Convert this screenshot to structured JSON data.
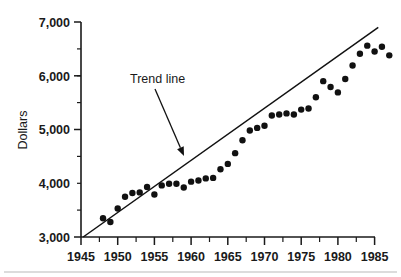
{
  "chart_data": {
    "type": "scatter",
    "title": "",
    "xlabel": "",
    "ylabel": "Dollars",
    "xlim": [
      1945,
      1985
    ],
    "ylim": [
      3000,
      7000
    ],
    "grid": false,
    "legend": "none",
    "x_ticks": [
      1945,
      1950,
      1955,
      1960,
      1965,
      1970,
      1975,
      1980,
      1985
    ],
    "x_tick_labels": [
      "1945",
      "1950",
      "1955",
      "1960",
      "1965",
      "1970",
      "1975",
      "1980",
      "1985"
    ],
    "x_minor_step": 2.5,
    "y_ticks": [
      3000,
      4000,
      5000,
      6000,
      7000
    ],
    "y_tick_labels": [
      "3,000",
      "4,000",
      "5,000",
      "6,000",
      "7,000"
    ],
    "y_minor_step": 500,
    "marker_color": "#111111",
    "marker_radius": 3.2,
    "points": [
      {
        "x": 1948,
        "y": 3350
      },
      {
        "x": 1949,
        "y": 3280
      },
      {
        "x": 1950,
        "y": 3530
      },
      {
        "x": 1951,
        "y": 3750
      },
      {
        "x": 1952,
        "y": 3820
      },
      {
        "x": 1953,
        "y": 3830
      },
      {
        "x": 1954,
        "y": 3930
      },
      {
        "x": 1955,
        "y": 3790
      },
      {
        "x": 1956,
        "y": 3960
      },
      {
        "x": 1957,
        "y": 3990
      },
      {
        "x": 1958,
        "y": 3990
      },
      {
        "x": 1959,
        "y": 3920
      },
      {
        "x": 1960,
        "y": 4030
      },
      {
        "x": 1961,
        "y": 4050
      },
      {
        "x": 1962,
        "y": 4090
      },
      {
        "x": 1963,
        "y": 4100
      },
      {
        "x": 1964,
        "y": 4260
      },
      {
        "x": 1965,
        "y": 4360
      },
      {
        "x": 1966,
        "y": 4560
      },
      {
        "x": 1967,
        "y": 4800
      },
      {
        "x": 1968,
        "y": 4980
      },
      {
        "x": 1969,
        "y": 5030
      },
      {
        "x": 1970,
        "y": 5070
      },
      {
        "x": 1971,
        "y": 5260
      },
      {
        "x": 1972,
        "y": 5280
      },
      {
        "x": 1973,
        "y": 5300
      },
      {
        "x": 1974,
        "y": 5280
      },
      {
        "x": 1975,
        "y": 5370
      },
      {
        "x": 1976,
        "y": 5390
      },
      {
        "x": 1977,
        "y": 5600
      },
      {
        "x": 1978,
        "y": 5900
      },
      {
        "x": 1979,
        "y": 5790
      },
      {
        "x": 1980,
        "y": 5690
      },
      {
        "x": 1981,
        "y": 5940
      },
      {
        "x": 1982,
        "y": 6190
      },
      {
        "x": 1983,
        "y": 6410
      },
      {
        "x": 1984,
        "y": 6560
      },
      {
        "x": 1985,
        "y": 6450
      },
      {
        "x": 1986,
        "y": 6540
      },
      {
        "x": 1987,
        "y": 6380
      }
    ],
    "trend_line": {
      "label": "Trend line",
      "x_start": 1945.3,
      "y_start": 3000,
      "x_end": 1985.5,
      "y_end": 6900
    },
    "annotation": {
      "text": "Trend line",
      "text_x": 130,
      "text_y": 83,
      "arrow_from_x": 155,
      "arrow_from_y": 89,
      "arrow_to_x": 184,
      "arrow_to_y": 156
    }
  }
}
